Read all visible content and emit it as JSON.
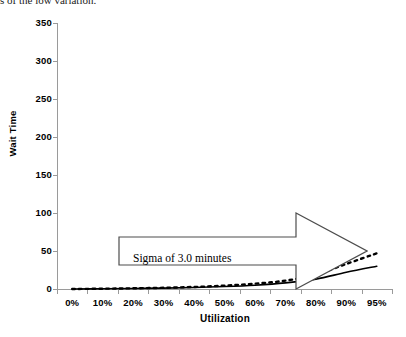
{
  "document": {
    "text_fragment": "s of the low variation."
  },
  "chart_data": {
    "type": "line",
    "title": "",
    "xlabel": "Utilization",
    "ylabel": "Wait Time",
    "categories": [
      "0%",
      "10%",
      "20%",
      "30%",
      "40%",
      "50%",
      "60%",
      "70%",
      "80%",
      "90%",
      "95%"
    ],
    "x": [
      0,
      10,
      20,
      30,
      40,
      50,
      60,
      70,
      80,
      90,
      95
    ],
    "ylim": [
      0,
      350
    ],
    "yticks": [
      0,
      50,
      100,
      150,
      200,
      250,
      300,
      350
    ],
    "ytick_labels": [
      "0",
      "50",
      "100",
      "150",
      "200",
      "250",
      "300",
      "350"
    ],
    "grid": false,
    "legend": "none",
    "series": [
      {
        "name": "solid-curve",
        "style": "solid",
        "color": "#000000",
        "values": [
          0,
          0.3,
          0.7,
          1.2,
          2.0,
          3.2,
          5.0,
          8.0,
          13.0,
          22.0,
          30.0
        ]
      },
      {
        "name": "dotted-curve",
        "style": "dotted",
        "color": "#000000",
        "values": [
          0,
          0.4,
          0.9,
          1.6,
          2.7,
          4.4,
          7.0,
          11.0,
          19.0,
          33.0,
          47.0
        ]
      }
    ],
    "annotations": [
      {
        "name": "sigma-arrow",
        "text": "Sigma of 3.0 minutes",
        "shape": "right-arrow",
        "x_start": 24,
        "x_end": 95,
        "y_value": 55
      }
    ]
  }
}
